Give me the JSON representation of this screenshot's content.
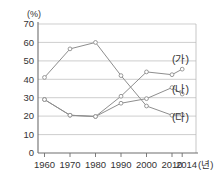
{
  "chart_data": {
    "type": "line",
    "title": "",
    "subtitle": "",
    "xlabel": "년",
    "ylabel": "(%)",
    "unit_label": "(%)",
    "x_axis_unit": "(년)",
    "categories": [
      "1960",
      "1970",
      "1980",
      "1990",
      "2000",
      "2010",
      "2014"
    ],
    "x": [
      1960,
      1970,
      1980,
      1990,
      2000,
      2010,
      2014
    ],
    "xlim": [
      1960,
      2014
    ],
    "ylim": [
      0,
      70
    ],
    "y_ticks": [
      "0",
      "10",
      "20",
      "30",
      "40",
      "50",
      "60",
      "70"
    ],
    "y_tick_values": [
      0,
      10,
      20,
      30,
      40,
      50,
      60,
      70
    ],
    "grid": true,
    "grid_axis": "y",
    "legend_position": "inline-right",
    "series": [
      {
        "name": "(가)",
        "label": "(가)",
        "color": "#8e8e8e",
        "values": [
          29,
          20.5,
          19.8,
          30.8,
          44,
          42.5,
          45.5
        ]
      },
      {
        "name": "(나)",
        "label": "(나)",
        "color": "#8e8e8e",
        "values": [
          29,
          20.5,
          19.8,
          27,
          29.5,
          35.5,
          32
        ]
      },
      {
        "name": "(다)",
        "label": "(다)",
        "color": "#8e8e8e",
        "values": [
          41,
          56.5,
          60,
          42,
          25.5,
          20.5,
          20.8
        ]
      }
    ]
  }
}
